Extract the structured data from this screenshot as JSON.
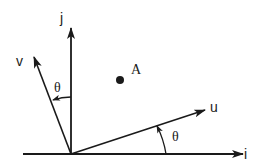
{
  "diagram": {
    "type": "vector-rotation",
    "axes": {
      "horizontal_label": "i",
      "vertical_label": "j"
    },
    "rotated_vectors": {
      "u_label": "u",
      "v_label": "v"
    },
    "angles": {
      "upper_label": "θ",
      "lower_label": "θ"
    },
    "point": {
      "label": "A"
    },
    "colors": {
      "stroke": "#1a1a1a",
      "background": "#ffffff"
    }
  }
}
